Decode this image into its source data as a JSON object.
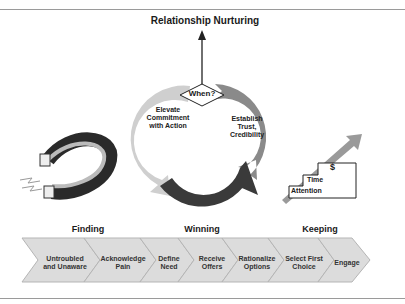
{
  "title": "Relationship Nurturing",
  "cycle": {
    "center_label": "When?",
    "segments": [
      {
        "label": "Establish Trust, Credibility",
        "color": "#8a8a8a"
      },
      {
        "label": "Gather Information",
        "color": "#3a3a3a"
      },
      {
        "label": "Elevate Commitment with Action",
        "color": "#cfcfcf"
      }
    ]
  },
  "stairs": {
    "steps": [
      "Attention",
      "Time",
      "$"
    ]
  },
  "phases": [
    "Finding",
    "Winning",
    "Keeping"
  ],
  "steps": [
    "Untroubled and Unaware",
    "Acknowledge Pain",
    "Define Need",
    "Receive Offers",
    "Rationalize Options",
    "Select First Choice",
    "Engage"
  ],
  "colors": {
    "chevron_fill": "#dcdcdc",
    "chevron_stroke": "#b5b5b5",
    "dark": "#3a3a3a",
    "mid": "#8a8a8a",
    "light": "#cfcfcf"
  }
}
